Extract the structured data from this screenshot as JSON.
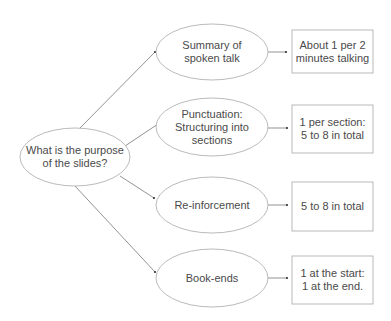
{
  "diagram": {
    "root": {
      "label": "What is the purpose\nof the slides?"
    },
    "branches": [
      {
        "label": "Summary of\nspoken talk",
        "detail": "About 1 per 2\nminutes talking"
      },
      {
        "label": "Punctuation:\nStructuring into\nsections",
        "detail": "1 per  section:\n5 to 8 in total"
      },
      {
        "label": "Re-inforcement",
        "detail": "5 to 8 in total"
      },
      {
        "label": "Book-ends",
        "detail": "1 at the start:\n1 at the end."
      }
    ],
    "colors": {
      "stroke": "#a0a0a0",
      "arrow": "#555555",
      "text": "#4a4a4a"
    }
  }
}
